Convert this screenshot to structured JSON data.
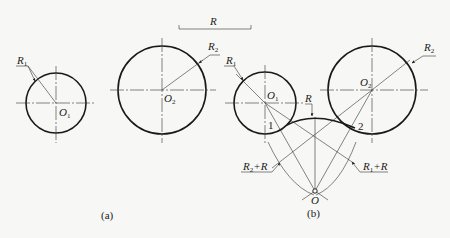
{
  "figure": {
    "reference_bar": {
      "label": "R"
    },
    "panel_a": {
      "caption": "(a)",
      "circle1": {
        "center_label": "O",
        "center_sub": "1",
        "radius_label": "R",
        "radius_sub": "1"
      },
      "circle2": {
        "center_label": "O",
        "center_sub": "2",
        "radius_label": "R",
        "radius_sub": "2"
      }
    },
    "panel_b": {
      "caption": "(b)",
      "circle1": {
        "center_label": "O",
        "center_sub": "1",
        "radius_label": "R",
        "radius_sub": "1"
      },
      "circle2": {
        "center_label": "O",
        "center_sub": "2",
        "radius_label": "R",
        "radius_sub": "2"
      },
      "arc_radius_label": "R",
      "tangent_points": [
        "1",
        "2"
      ],
      "construction_arc_left": {
        "label": "R",
        "sub": "2",
        "suffix": "+R"
      },
      "construction_arc_right": {
        "label": "R",
        "sub": "1",
        "suffix": "+R"
      },
      "arc_center_label": "O"
    }
  }
}
